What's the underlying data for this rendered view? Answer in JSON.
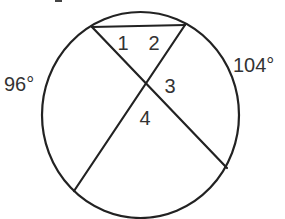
{
  "diagram": {
    "type": "circle-with-intersecting-chords",
    "colors": {
      "background": "#ffffff",
      "stroke": "#222222",
      "text": "#333333"
    },
    "circle": {
      "cx": 140.5,
      "cy": 115,
      "rx": 98.5,
      "ry": 103
    },
    "chords": [
      {
        "id": "top-chord",
        "x1": 92,
        "y1": 27,
        "x2": 185,
        "y2": 25
      },
      {
        "id": "chord-a",
        "x1": 92,
        "y1": 27,
        "x2": 227,
        "y2": 168
      },
      {
        "id": "chord-b",
        "x1": 185,
        "y1": 25,
        "x2": 74,
        "y2": 191
      }
    ],
    "angle_labels": {
      "angle1": "1",
      "angle2": "2",
      "angle3": "3",
      "angle4": "4"
    },
    "arc_labels": {
      "left_arc": "96°",
      "right_arc": "104°"
    }
  }
}
